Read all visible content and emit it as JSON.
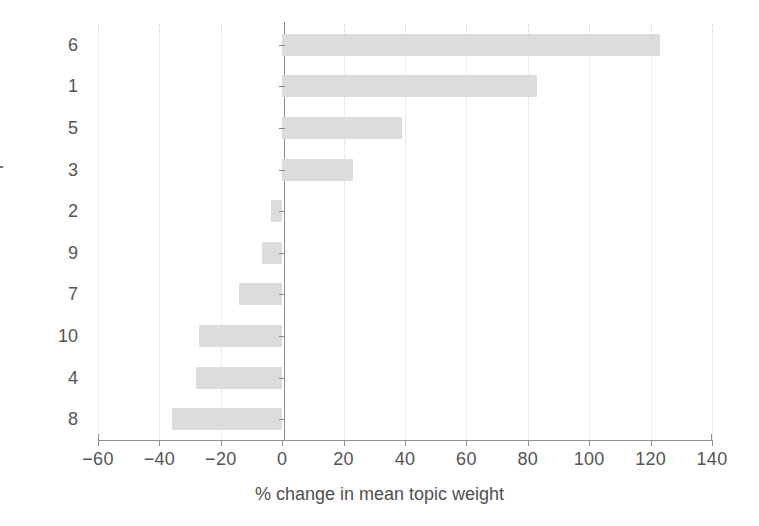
{
  "chart_data": {
    "type": "bar",
    "orientation": "horizontal",
    "title": "",
    "subtitle": "",
    "xlabel": "% change in mean topic weight",
    "ylabel": "Topic number",
    "categories": [
      "6",
      "1",
      "5",
      "3",
      "2",
      "9",
      "7",
      "10",
      "4",
      "8"
    ],
    "values": [
      123,
      83,
      39,
      23,
      -3.5,
      -6.5,
      -14,
      -27,
      -28,
      -36
    ],
    "series": [
      {
        "name": "% change in mean topic weight",
        "values": [
          123,
          83,
          39,
          23,
          -3.5,
          -6.5,
          -14,
          -27,
          -28,
          -36
        ]
      }
    ],
    "xlim": [
      -60,
      140
    ],
    "xticks": [
      -60,
      -40,
      -20,
      0,
      20,
      40,
      60,
      80,
      100,
      120,
      140
    ],
    "xtick_labels": [
      "−60",
      "−40",
      "−20",
      "0",
      "20",
      "40",
      "60",
      "80",
      "100",
      "120",
      "140"
    ],
    "ytick_labels": [
      "6",
      "1",
      "5",
      "3",
      "2",
      "9",
      "7",
      "10",
      "4",
      "8"
    ],
    "grid": true,
    "grid_axis": "x",
    "grid_style": "dotted",
    "legend": false,
    "legend_position": "none",
    "bar_color": "#dcdcdc",
    "axis_color": "#8f8f8f",
    "grid_color": "#d9d9d9",
    "text_color": "#4f4f4f",
    "background_color": "#ffffff",
    "zero_line": 0,
    "annotations": []
  },
  "axes": {
    "x_title": "% change in mean topic weight",
    "y_title": "Topic number"
  }
}
